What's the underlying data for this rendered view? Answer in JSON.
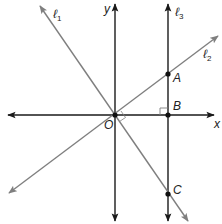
{
  "diagram": {
    "type": "coordinate-geometry",
    "colors": {
      "axis": "#1a1a1a",
      "line_l1": "#808080",
      "line_l2": "#808080",
      "line_l3": "#1a1a1a",
      "point": "#111111"
    },
    "axes": {
      "x_label": "x",
      "y_label": "y"
    },
    "lines": [
      {
        "id": "l1",
        "label": "ℓ",
        "subscript": "1"
      },
      {
        "id": "l2",
        "label": "ℓ",
        "subscript": "2"
      },
      {
        "id": "l3",
        "label": "ℓ",
        "subscript": "3"
      }
    ],
    "points": [
      {
        "id": "O",
        "label": "O"
      },
      {
        "id": "A",
        "label": "A"
      },
      {
        "id": "B",
        "label": "B"
      },
      {
        "id": "C",
        "label": "C"
      }
    ],
    "markers": [
      {
        "id": "right-angle-B",
        "description": "right angle at B between x-axis and ℓ3"
      },
      {
        "id": "right-angle-O",
        "description": "right angle at O between ℓ1 and ℓ2"
      }
    ]
  }
}
